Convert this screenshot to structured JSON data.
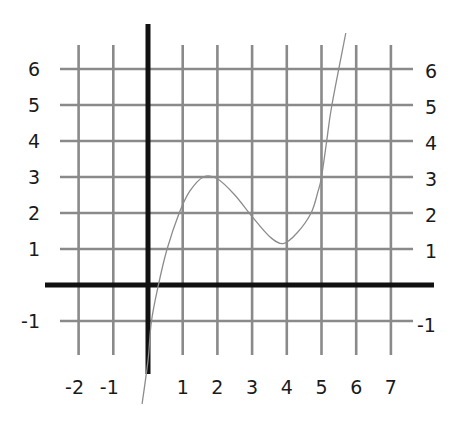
{
  "chart_data": {
    "type": "line",
    "title": "",
    "xlabel": "",
    "ylabel": "",
    "xlim": [
      -2,
      7
    ],
    "ylim": [
      -1,
      6
    ],
    "grid": true,
    "legend": null,
    "x_tick_labels": [
      "-2",
      "-1",
      "1",
      "2",
      "3",
      "4",
      "5",
      "6",
      "7"
    ],
    "y_tick_labels_left": [
      "6",
      "5",
      "4",
      "3",
      "2",
      "1",
      "-1"
    ],
    "y_tick_labels_right": [
      "6",
      "5",
      "4",
      "3",
      "2",
      "1",
      "-1"
    ],
    "series": [
      {
        "name": "f(x)",
        "description": "cubic-shaped curve with local max near (1.7, 3) and local min near (3.9, 1.1)",
        "x": [
          -0.17,
          0.0,
          0.1,
          0.3,
          0.55,
          0.9,
          1.2,
          1.6,
          2.0,
          2.5,
          3.0,
          3.5,
          3.9,
          4.3,
          4.7,
          4.9,
          5.0,
          5.15,
          5.3,
          5.7
        ],
        "y": [
          -3.3,
          -2.1,
          -1.0,
          0.0,
          1.0,
          2.0,
          2.6,
          3.0,
          2.95,
          2.5,
          1.9,
          1.35,
          1.15,
          1.45,
          2.0,
          2.6,
          3.0,
          4.0,
          5.0,
          7.0
        ]
      }
    ],
    "key_points": {
      "local_max": [
        1.7,
        3.0
      ],
      "local_min": [
        3.9,
        1.1
      ]
    }
  }
}
